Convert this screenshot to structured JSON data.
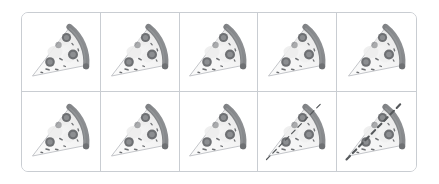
{
  "figure": {
    "kind": "pizza-slice-grid",
    "rows": 2,
    "columns": 5,
    "background_color": "#ffffff",
    "border_color": "#c9cdd2",
    "border_radius_px": 7
  },
  "palette": {
    "crust_dark": "#808285",
    "crust_mid": "#9b9ea1",
    "crust_edge": "#6f7174",
    "cheese_light": "#f4f4f4",
    "cheese_shadow": "#e3e3e3",
    "pepperoni_dark": "#6e7073",
    "pepperoni_mid": "#8c8e91",
    "herb": "#6e7073",
    "outline": "#b9bcc0",
    "dash_line": "#55585b"
  },
  "cells": [
    {
      "index": 1,
      "row": 1,
      "column": 1,
      "name": "pizza-slice-cell-1",
      "label": "",
      "has_dashed_cut": false,
      "dash_style": "none",
      "dash_width_px": 0
    },
    {
      "index": 2,
      "row": 1,
      "column": 2,
      "name": "pizza-slice-cell-2",
      "label": "",
      "has_dashed_cut": false,
      "dash_style": "none",
      "dash_width_px": 0
    },
    {
      "index": 3,
      "row": 1,
      "column": 3,
      "name": "pizza-slice-cell-3",
      "label": "",
      "has_dashed_cut": false,
      "dash_style": "none",
      "dash_width_px": 0
    },
    {
      "index": 4,
      "row": 1,
      "column": 4,
      "name": "pizza-slice-cell-4",
      "label": "",
      "has_dashed_cut": false,
      "dash_style": "none",
      "dash_width_px": 0
    },
    {
      "index": 5,
      "row": 1,
      "column": 5,
      "name": "pizza-slice-cell-5",
      "label": "",
      "has_dashed_cut": false,
      "dash_style": "none",
      "dash_width_px": 0
    },
    {
      "index": 6,
      "row": 2,
      "column": 1,
      "name": "pizza-slice-cell-6",
      "label": "",
      "has_dashed_cut": false,
      "dash_style": "none",
      "dash_width_px": 0
    },
    {
      "index": 7,
      "row": 2,
      "column": 2,
      "name": "pizza-slice-cell-7",
      "label": "",
      "has_dashed_cut": false,
      "dash_style": "none",
      "dash_width_px": 0
    },
    {
      "index": 8,
      "row": 2,
      "column": 3,
      "name": "pizza-slice-cell-8",
      "label": "",
      "has_dashed_cut": false,
      "dash_style": "none",
      "dash_width_px": 0
    },
    {
      "index": 9,
      "row": 2,
      "column": 4,
      "name": "pizza-slice-cell-9",
      "label": "",
      "has_dashed_cut": true,
      "dash_style": "thin",
      "dash_width_px": 1.2
    },
    {
      "index": 10,
      "row": 2,
      "column": 5,
      "name": "pizza-slice-cell-10",
      "label": "",
      "has_dashed_cut": true,
      "dash_style": "thick",
      "dash_width_px": 2.1
    }
  ]
}
